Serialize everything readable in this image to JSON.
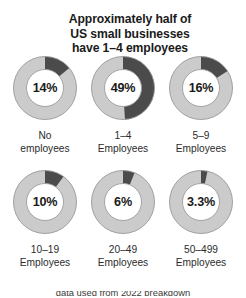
{
  "title": {
    "line1": "Approximately half of",
    "line2": "US small businesses",
    "line3": "have 1–4 employees"
  },
  "colors": {
    "segment_dark": "#4b4b4b",
    "segment_light": "#cbcbcb",
    "ring_outline": "#9a9a9a",
    "center_fill": "#ffffff",
    "text": "#1a1a1a"
  },
  "source": {
    "text_fragment": "data used from 2022 breakdown"
  },
  "chart_data": {
    "type": "pie",
    "title": "Approximately half of US small businesses have 1–4 employees",
    "subtitle": "",
    "xlabel": "",
    "ylabel": "",
    "legend": [],
    "grid": false,
    "layout": "2 rows × 3 columns of donut charts",
    "units": "percent of US small businesses",
    "categories": [
      "No employees",
      "1–4 Employees",
      "5–9 Employees",
      "10–19 Employees",
      "20–49 Employees",
      "50–499 Employees"
    ],
    "values": [
      14,
      49,
      16,
      10,
      6,
      3.3
    ],
    "value_labels": [
      "14%",
      "49%",
      "16%",
      "10%",
      "6%",
      "3.3%"
    ],
    "donuts": [
      {
        "id": "donut-no-employees",
        "value": 14,
        "value_label": "14%",
        "caption_line1": "No",
        "caption_line2": "employees",
        "row": 1,
        "column": 1
      },
      {
        "id": "donut-1-4-employees",
        "value": 49,
        "value_label": "49%",
        "caption_line1": "1–4",
        "caption_line2": "Employees",
        "row": 1,
        "column": 2
      },
      {
        "id": "donut-5-9-employees",
        "value": 16,
        "value_label": "16%",
        "caption_line1": "5–9",
        "caption_line2": "Employees",
        "row": 1,
        "column": 3
      },
      {
        "id": "donut-10-19-employees",
        "value": 10,
        "value_label": "10%",
        "caption_line1": "10–19",
        "caption_line2": "Employees",
        "row": 2,
        "column": 1
      },
      {
        "id": "donut-20-49-employees",
        "value": 6,
        "value_label": "6%",
        "caption_line1": "20–49",
        "caption_line2": "Employees",
        "row": 2,
        "column": 2
      },
      {
        "id": "donut-50-499-employees",
        "value": 3.3,
        "value_label": "3.3%",
        "caption_line1": "50–499",
        "caption_line2": "Employees",
        "row": 2,
        "column": 3
      }
    ]
  }
}
